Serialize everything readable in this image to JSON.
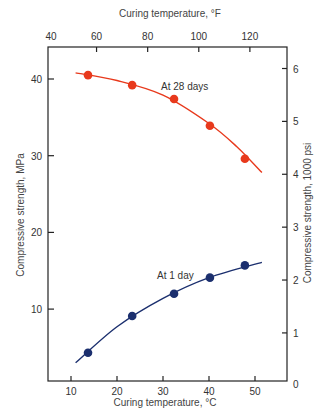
{
  "chart_data": {
    "type": "scatter",
    "title": "",
    "xlabel": "Curing temperature, °C",
    "xlabel_top": "Curing temperature, °F",
    "ylabel": "Compressive strength, MPa",
    "ylabel_right": "Compressive strength, 1000 psi",
    "xlim": [
      5,
      57
    ],
    "ylim": [
      0,
      43.5
    ],
    "x_ticks": [
      10,
      20,
      30,
      40,
      50
    ],
    "x_top_ticks": [
      40,
      60,
      80,
      100,
      120
    ],
    "y_ticks": [
      10,
      20,
      30,
      40
    ],
    "y_right_ticks": [
      0,
      1,
      2,
      3,
      4,
      5,
      6
    ],
    "grid": false,
    "legend": "inline labels",
    "series": [
      {
        "name": "At 28 days",
        "color": "#e8391c",
        "points": [
          {
            "x": 13.7,
            "y": 40.5
          },
          {
            "x": 23.3,
            "y": 39.2
          },
          {
            "x": 32.4,
            "y": 37.4
          },
          {
            "x": 40.2,
            "y": 33.9
          },
          {
            "x": 47.8,
            "y": 29.6
          }
        ],
        "curve": [
          {
            "x": 11,
            "y": 40.8
          },
          {
            "x": 20,
            "y": 39.8
          },
          {
            "x": 30,
            "y": 37.9
          },
          {
            "x": 40,
            "y": 34.2
          },
          {
            "x": 46,
            "y": 31.2
          },
          {
            "x": 51.5,
            "y": 27.8
          }
        ],
        "label_position": {
          "x": 31,
          "y": 39.5
        }
      },
      {
        "name": "At 1 day",
        "color": "#1b2f6e",
        "points": [
          {
            "x": 13.7,
            "y": 4.3
          },
          {
            "x": 23.3,
            "y": 9.1
          },
          {
            "x": 32.4,
            "y": 12.0
          },
          {
            "x": 40.2,
            "y": 14.1
          },
          {
            "x": 47.8,
            "y": 15.7
          }
        ],
        "curve": [
          {
            "x": 11,
            "y": 3.0
          },
          {
            "x": 20,
            "y": 7.7
          },
          {
            "x": 30,
            "y": 11.4
          },
          {
            "x": 40,
            "y": 14.1
          },
          {
            "x": 51.5,
            "y": 16.1
          }
        ],
        "label_position": {
          "x": 30.3,
          "y": 14.6
        }
      }
    ]
  },
  "labels": {
    "x_bottom_title": "Curing temperature, °C",
    "x_top_title": "Curing temperature, °F",
    "y_left_title": "Compressive strength, MPa",
    "y_right_title": "Compressive strength, 1000 psi",
    "series_28": "At 28 days",
    "series_1": "At 1 day"
  }
}
